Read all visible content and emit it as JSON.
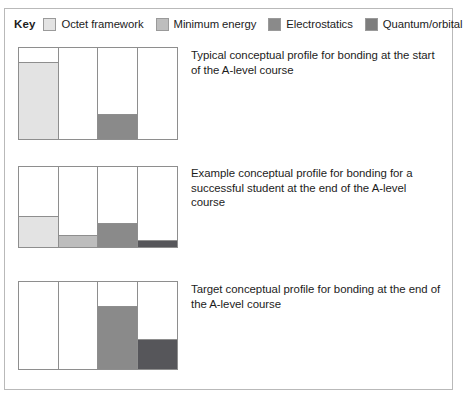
{
  "key": {
    "label": "Key",
    "entries": [
      {
        "name": "octet-framework",
        "label": "Octet framework",
        "color": "#e3e3e3"
      },
      {
        "name": "minimum-energy",
        "label": "Minimum energy",
        "color": "#bdbdbd"
      },
      {
        "name": "electrostatics",
        "label": "Electrostatics",
        "color": "#8a8a8a"
      },
      {
        "name": "quantum-orbital",
        "label": "Quantum/orbital",
        "color": "#7d7d7d"
      }
    ]
  },
  "panels": [
    {
      "id": "panel-1",
      "caption": "Typical conceptual profile for bonding at the start of the A-level course",
      "chart_index": 0
    },
    {
      "id": "panel-2",
      "caption": "Example conceptual profile for bonding for a successful student at the end of the A-level course",
      "chart_index": 1
    },
    {
      "id": "panel-3",
      "caption": "Target conceptual profile for bonding at the end of the A-level course",
      "chart_index": 2
    }
  ],
  "chart_data": [
    {
      "type": "bar",
      "title": "Typical conceptual profile for bonding at the start of the A-level course",
      "categories": [
        "Octet framework",
        "Minimum energy",
        "Electrostatics",
        "Quantum/orbital"
      ],
      "values": [
        84,
        0,
        26,
        0
      ],
      "colors": [
        "#e3e3e3",
        "#bdbdbd",
        "#8a8a8a",
        "#7d7d7d"
      ],
      "xlabel": "",
      "ylabel": "",
      "ylim": [
        0,
        100
      ],
      "grid": false,
      "legend": "top"
    },
    {
      "type": "bar",
      "title": "Example conceptual profile for bonding for a successful student at the end of the A-level course",
      "categories": [
        "Octet framework",
        "Minimum energy",
        "Electrostatics",
        "Quantum/orbital"
      ],
      "values": [
        38,
        14,
        29,
        7
      ],
      "colors": [
        "#e3e3e3",
        "#bdbdbd",
        "#8a8a8a",
        "#56565a"
      ],
      "xlabel": "",
      "ylabel": "",
      "ylim": [
        0,
        100
      ],
      "grid": false,
      "legend": "top"
    },
    {
      "type": "bar",
      "title": "Target conceptual profile for bonding at the end of the A-level course",
      "categories": [
        "Octet framework",
        "Minimum energy",
        "Electrostatics",
        "Quantum/orbital"
      ],
      "values": [
        0,
        0,
        71,
        33
      ],
      "colors": [
        "#e3e3e3",
        "#bdbdbd",
        "#8a8a8a",
        "#56565a"
      ],
      "xlabel": "",
      "ylabel": "",
      "ylim": [
        0,
        100
      ],
      "grid": false,
      "legend": "top"
    }
  ]
}
